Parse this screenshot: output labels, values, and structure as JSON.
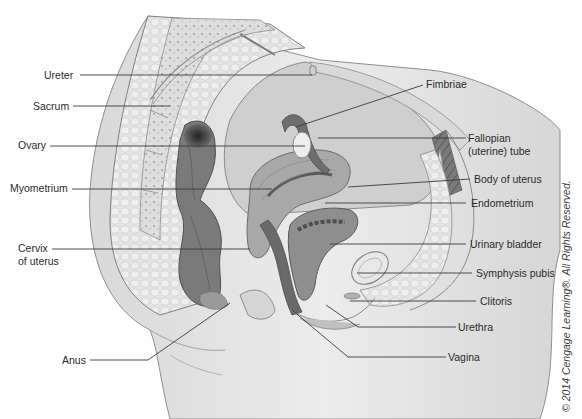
{
  "figure": {
    "copyright": "© 2014 Cengage Learning®. All Rights Reserved."
  },
  "labels_left": [
    {
      "id": "ureter",
      "text": "Ureter",
      "x": 44,
      "y": 69,
      "line": [
        80,
        75,
        312,
        75
      ]
    },
    {
      "id": "sacrum",
      "text": "Sacrum",
      "x": 33,
      "y": 100,
      "line": [
        73,
        106,
        170,
        106
      ]
    },
    {
      "id": "ovary",
      "text": "Ovary",
      "x": 18,
      "y": 139,
      "line": [
        50,
        146,
        305,
        146
      ]
    },
    {
      "id": "myometrium",
      "text": "Myometrium",
      "x": 10,
      "y": 182,
      "line": [
        72,
        189,
        272,
        189
      ]
    },
    {
      "id": "cervix",
      "text": "Cervix\nof uterus",
      "x": 18,
      "y": 242,
      "line": [
        52,
        249,
        250,
        249
      ]
    },
    {
      "id": "anus",
      "text": "Anus",
      "x": 62,
      "y": 354,
      "line": [
        90,
        360,
        148,
        360,
        230,
        303
      ]
    }
  ],
  "labels_right": [
    {
      "id": "fimbriae",
      "text": "Fimbriae",
      "x": 426,
      "y": 78,
      "line": [
        423,
        85,
        296,
        127
      ]
    },
    {
      "id": "fallopian",
      "text": "Fallopian\n(uterine) tube",
      "x": 468,
      "y": 132,
      "line": [
        466,
        138,
        318,
        138
      ]
    },
    {
      "id": "body_of_uterus",
      "text": "Body of uterus",
      "x": 474,
      "y": 173,
      "line": [
        470,
        179,
        348,
        187
      ]
    },
    {
      "id": "endometrium",
      "text": "Endometrium",
      "x": 471,
      "y": 197,
      "line": [
        466,
        203,
        325,
        203
      ]
    },
    {
      "id": "urinary_bladder",
      "text": "Urinary bladder",
      "x": 470,
      "y": 238,
      "line": [
        466,
        244,
        330,
        244
      ]
    },
    {
      "id": "symphysis_pubis",
      "text": "Symphysis pubis",
      "x": 476,
      "y": 267,
      "line": [
        472,
        273,
        357,
        273
      ]
    },
    {
      "id": "clitoris",
      "text": "Clitoris",
      "x": 480,
      "y": 295,
      "line": [
        476,
        301,
        350,
        301
      ]
    },
    {
      "id": "urethra",
      "text": "Urethra",
      "x": 458,
      "y": 321,
      "line": [
        456,
        327,
        358,
        327,
        326,
        305
      ]
    },
    {
      "id": "vagina",
      "text": "Vagina",
      "x": 448,
      "y": 351,
      "line": [
        446,
        357,
        348,
        357,
        292,
        310
      ]
    }
  ],
  "colors": {
    "skin": "#e6e6e6",
    "skin_edge": "#8a8a8a",
    "fat": "#dcdcdc",
    "bone": "#d2d2d2",
    "muscle_dark": "#6e6e6e",
    "organ_mid": "#9a9a9a",
    "peritoneum": "#c8c8c8",
    "leader": "#3a3a3a"
  }
}
